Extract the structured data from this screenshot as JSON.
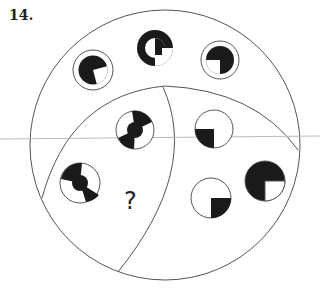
{
  "question": {
    "number": "14.",
    "unknown_label": "?"
  },
  "colors": {
    "ink": "#1a1a1a",
    "outline": "#555555",
    "guide_line": "#bbbbbb",
    "background": "#ffffff"
  },
  "regions": [
    {
      "name": "outer-top",
      "symbols": [
        "ringed-circle-white-lower-right-quarter",
        "thick-ring-with-inner-quarter",
        "ringed-circle-white-lower-left-quarter"
      ]
    },
    {
      "name": "lower-left",
      "symbols": [
        "ringed-circle-bowtie-rotated",
        "ringed-circle-bowtie",
        "unknown"
      ]
    },
    {
      "name": "lower-right",
      "symbols": [
        "circle-black-lower-left-quarter",
        "circle-black-lower-right-quarter",
        "solid-circle-white-lower-right-quarter"
      ]
    }
  ]
}
